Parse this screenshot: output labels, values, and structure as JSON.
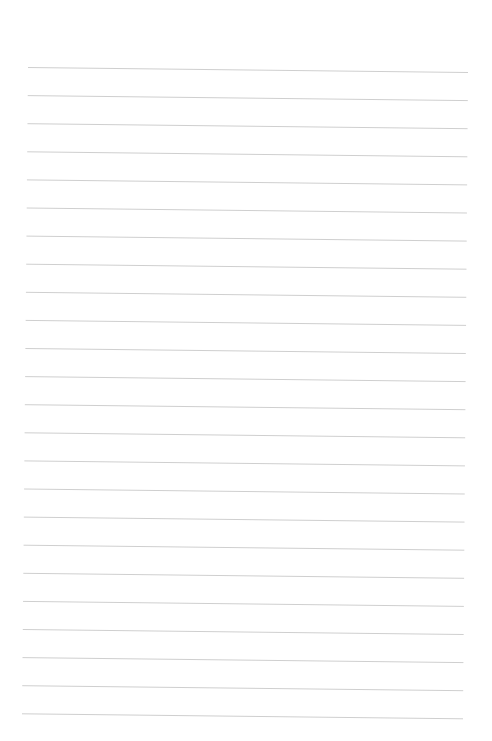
{
  "page": {
    "type": "lined-paper",
    "background": "#ffffff",
    "line_color": "#cfcfcf",
    "line_count": 24,
    "first_line_y": 70,
    "line_spacing": 28.1,
    "left_x_top": 28,
    "right_x_top": 468,
    "left_x_bottom": 22,
    "right_x_bottom": 463,
    "tilt_px": 5
  }
}
